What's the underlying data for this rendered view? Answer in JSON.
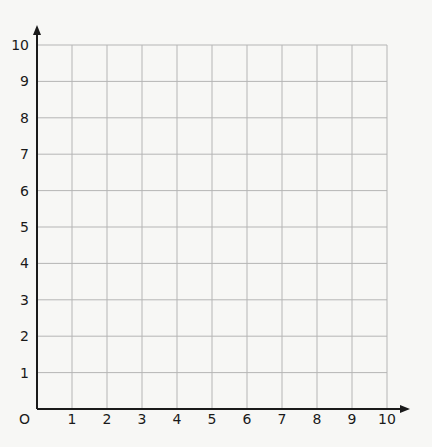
{
  "chart_data": {
    "type": "scatter",
    "title": "",
    "xlabel": "",
    "ylabel": "",
    "origin_label": "O",
    "x_ticks": [
      "1",
      "2",
      "3",
      "4",
      "5",
      "6",
      "7",
      "8",
      "9",
      "10"
    ],
    "y_ticks": [
      "1",
      "2",
      "3",
      "4",
      "5",
      "6",
      "7",
      "8",
      "9",
      "10"
    ],
    "xlim": [
      0,
      10
    ],
    "ylim": [
      0,
      10
    ],
    "grid": true,
    "series": [],
    "colors": {
      "grid": "#b5b5b5",
      "axis": "#1a1a1a",
      "background": "#f7f7f5"
    }
  }
}
